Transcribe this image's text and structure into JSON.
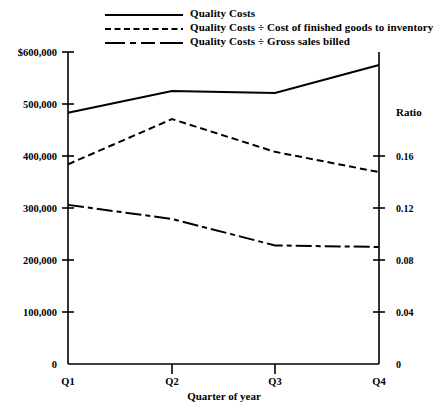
{
  "chart_data": {
    "type": "line",
    "title": "",
    "xlabel": "Quarter of year",
    "ylabel": "",
    "ylabel_right": "Ratio",
    "categories": [
      "Q1",
      "Q2",
      "Q3",
      "Q4"
    ],
    "grid": false,
    "legend_position": "top",
    "ylim": [
      0,
      600000
    ],
    "ylim_right": [
      0,
      0.2
    ],
    "yticks": [
      "0",
      "100,000",
      "200,000",
      "300,000",
      "400,000",
      "500,000",
      "$600,000"
    ],
    "ytick_values": [
      0,
      100000,
      200000,
      300000,
      400000,
      500000,
      600000
    ],
    "yticks_right": [
      "0",
      "0.04",
      "0.08",
      "0.12",
      "0.16"
    ],
    "ytick_values_right": [
      0,
      0.04,
      0.08,
      0.12,
      0.16
    ],
    "xticks": [
      "Q1",
      "Q2",
      "Q3",
      "Q4"
    ],
    "series": [
      {
        "name": "Quality Costs",
        "style": "solid",
        "axis": "left",
        "values": [
          483000,
          525000,
          521000,
          575000
        ]
      },
      {
        "name": "Quality Costs ÷ Cost of finished goods to inventory",
        "style": "dashed",
        "axis": "right",
        "values": [
          0.128,
          0.157,
          0.136,
          0.123
        ]
      },
      {
        "name": "Quality Costs ÷ Gross sales billed",
        "style": "dash-dot",
        "axis": "right",
        "values": [
          0.102,
          0.093,
          0.076,
          0.075
        ]
      }
    ]
  },
  "legend": {
    "items": [
      {
        "label": "Quality Costs",
        "style": "solid"
      },
      {
        "label": "Quality Costs ÷ Cost of finished goods to inventory",
        "style": "dashed"
      },
      {
        "label": "Quality Costs ÷ Gross sales billed",
        "style": "dash-dot"
      }
    ]
  },
  "axes": {
    "left": {
      "tick_labels": [
        "$600,000",
        "500,000",
        "400,000",
        "300,000",
        "200,000",
        "100,000",
        "0"
      ]
    },
    "right": {
      "title": "Ratio",
      "tick_labels": [
        "0.16",
        "0.12",
        "0.08",
        "0.04",
        "0"
      ]
    },
    "bottom": {
      "title": "Quarter of year",
      "tick_labels": [
        "Q1",
        "Q2",
        "Q3",
        "Q4"
      ]
    }
  }
}
